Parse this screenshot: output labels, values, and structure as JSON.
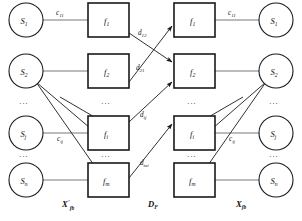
{
  "diagram": {
    "columns": [
      {
        "id": "left-sources",
        "type": "circle",
        "group_label": "X'",
        "group_sub": "fb"
      },
      {
        "id": "left-features",
        "type": "square"
      },
      {
        "id": "right-features",
        "type": "square"
      },
      {
        "id": "right-sources",
        "type": "circle",
        "group_label": "X",
        "group_sub": "fb"
      }
    ],
    "left_sources": [
      {
        "name": "S",
        "sub": "1"
      },
      {
        "name": "S",
        "sub": "2"
      },
      {
        "name": "S",
        "sub": "j"
      },
      {
        "name": "S",
        "sub": "n"
      }
    ],
    "left_features": [
      {
        "name": "f",
        "sub": "1"
      },
      {
        "name": "f",
        "sub": "2"
      },
      {
        "name": "f",
        "sub": "i"
      },
      {
        "name": "f",
        "sub": "m"
      }
    ],
    "right_features": [
      {
        "name": "f",
        "sub": "1"
      },
      {
        "name": "f",
        "sub": "2"
      },
      {
        "name": "f",
        "sub": "i"
      },
      {
        "name": "f",
        "sub": "m"
      }
    ],
    "right_sources": [
      {
        "name": "S",
        "sub": "1"
      },
      {
        "name": "S",
        "sub": "2"
      },
      {
        "name": "S",
        "sub": "j"
      },
      {
        "name": "S",
        "sub": "n"
      }
    ],
    "c_labels": [
      {
        "name": "c",
        "sub": "11"
      },
      {
        "name": "c",
        "sub": "ij"
      },
      {
        "name": "c",
        "sub": "11"
      },
      {
        "name": "c",
        "sub": "ij"
      }
    ],
    "d_labels": [
      {
        "name": "d",
        "sub": "12"
      },
      {
        "name": "d",
        "sub": "21"
      },
      {
        "name": "d",
        "sub": "ij"
      },
      {
        "name": "d",
        "sub": "mi"
      }
    ],
    "group_labels": {
      "left": {
        "name": "X",
        "prime": "'",
        "sub": "fb"
      },
      "middle": {
        "name": "D",
        "sub": "F"
      },
      "right": {
        "name": "X",
        "prime": "",
        "sub": "fb"
      }
    },
    "ellipsis": "···"
  }
}
